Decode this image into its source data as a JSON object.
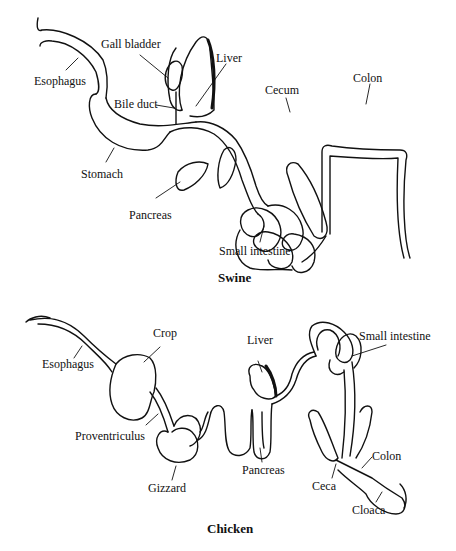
{
  "figure": {
    "panels": [
      {
        "caption": "Swine",
        "labels": {
          "esophagus": "Esophagus",
          "gall_bladder": "Gall bladder",
          "liver": "Liver",
          "bile_duct": "Bile duct",
          "stomach": "Stomach",
          "cecum": "Cecum",
          "colon": "Colon",
          "pancreas": "Pancreas",
          "small_intestine": "Small intestine"
        }
      },
      {
        "caption": "Chicken",
        "labels": {
          "esophagus": "Esophagus",
          "crop": "Crop",
          "liver": "Liver",
          "small_intestine": "Small intestine",
          "proventriculus": "Proventriculus",
          "gizzard": "Gizzard",
          "pancreas": "Pancreas",
          "ceca": "Ceca",
          "colon": "Colon",
          "cloaca": "Cloaca"
        }
      }
    ]
  },
  "colors": {
    "ink": "#111111",
    "background": "#ffffff"
  }
}
